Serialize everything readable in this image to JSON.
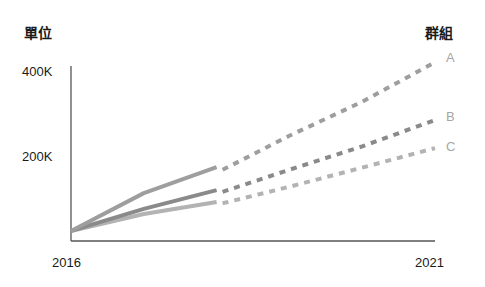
{
  "chart_data": {
    "type": "line",
    "title": "",
    "ylabel": "單位",
    "legend_title": "群組",
    "xlabel": "",
    "x": [
      2016,
      2017,
      2018,
      2019,
      2020,
      2021
    ],
    "x_tick_labels": [
      "2016",
      "2021"
    ],
    "y_tick_labels": [
      "400K",
      "200K"
    ],
    "ylim": [
      0,
      420000
    ],
    "grid": false,
    "legend_position": "right-inline",
    "actual_until": 2018,
    "projected_from": 2018,
    "series": [
      {
        "name": "A",
        "color": "#9e9e9e",
        "values": [
          26000,
          115000,
          176000,
          250000,
          330000,
          423000
        ]
      },
      {
        "name": "B",
        "color": "#8a8a8a",
        "values": [
          26000,
          78000,
          122000,
          170000,
          225000,
          287000
        ]
      },
      {
        "name": "C",
        "color": "#b3b3b3",
        "values": [
          26000,
          66000,
          94000,
          130000,
          175000,
          221000
        ]
      }
    ]
  },
  "labels": {
    "unit": "單位",
    "group": "群組",
    "y_400k": "400K",
    "y_200k": "200K",
    "x_start": "2016",
    "x_end": "2021",
    "series_a": "A",
    "series_b": "B",
    "series_c": "C"
  }
}
